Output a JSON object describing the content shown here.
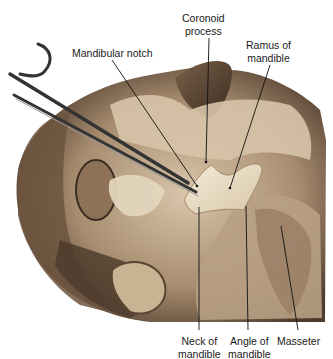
{
  "figure": {
    "type": "anatomical photograph",
    "colors": {
      "background": "#ffffff",
      "tissue_light": "#e6d7c2",
      "tissue_mid": "#b9a184",
      "tissue_dark": "#5e4a38",
      "bone": "#efe4cf",
      "shadow": "#2f241b",
      "instrument": "#3a3a3a",
      "leader_line": "#111111"
    }
  },
  "labels": {
    "coronoid_process": {
      "line1": "Coronoid",
      "line2": "process"
    },
    "mandibular_notch": {
      "line1": "Mandibular notch"
    },
    "ramus_of_mandible": {
      "line1": "Ramus of",
      "line2": "mandible"
    },
    "neck_of_mandible": {
      "line1": "Neck of",
      "line2": "mandible"
    },
    "angle_of_mandible": {
      "line1": "Angle of",
      "line2": "mandible"
    },
    "masseter": {
      "line1": "Masseter"
    }
  }
}
